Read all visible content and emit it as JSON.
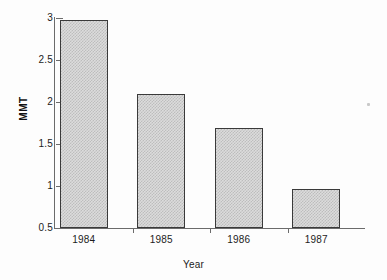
{
  "chart_data": {
    "type": "bar",
    "title": "",
    "subtitle": "",
    "xlabel": "Year",
    "ylabel": "MMT",
    "categories": [
      "1984",
      "1985",
      "1986",
      "1987"
    ],
    "values": [
      2.98,
      2.09,
      1.69,
      0.97
    ],
    "series": [
      {
        "name": "MMT",
        "values": [
          2.98,
          2.09,
          1.69,
          0.97
        ]
      }
    ],
    "ylim": [
      0.5,
      3
    ],
    "yticks": [
      "0.5",
      "1",
      "1.5",
      "2",
      "2.5",
      "3"
    ],
    "ytick_values": [
      0.5,
      1,
      1.5,
      2,
      2.5,
      3
    ],
    "xticks": [
      "1984",
      "1985",
      "1986",
      "1987"
    ],
    "grid": false,
    "legend": false,
    "legend_position": "none",
    "annotations": [],
    "colors": {
      "bar_fill": "#dcdcdc",
      "bar_hatch": "#bdbdbd",
      "bar_outline": "#3a3a3a",
      "axis": "#6b6b6b",
      "text": "#1c1c1c",
      "background": "#fdfdfd"
    }
  }
}
